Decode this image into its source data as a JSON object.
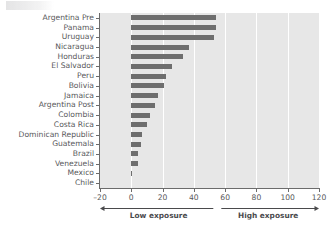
{
  "figure": {
    "title_artifact": "",
    "background_color": "#ffffff",
    "plot_background_color": "#e7e7e7",
    "bar_color": "#6e6e6e",
    "gridline_color": "#ffffff",
    "axis_color": "#6b6b6b",
    "text_color": "#58585a"
  },
  "annotation": {
    "low_label": "Low exposure",
    "high_label": "High exposure",
    "split_value": 55,
    "arrow_start": -20,
    "arrow_end": 120
  },
  "chart_data": {
    "type": "bar",
    "orientation": "horizontal",
    "title": "",
    "xlabel": "",
    "ylabel": "",
    "xlim": [
      -20,
      120
    ],
    "ylim": [
      0,
      18
    ],
    "xticks": [
      -20,
      0,
      20,
      40,
      60,
      80,
      100,
      120
    ],
    "xtick_labels": [
      "–20",
      "0",
      "20",
      "40",
      "60",
      "80",
      "100",
      "120"
    ],
    "grid": "vertical-white-at-xticks",
    "legend": "none",
    "categories": [
      "Argentina Pre",
      "Panama",
      "Uruguay",
      "Nicaragua",
      "Honduras",
      "El Salvador",
      "Peru",
      "Bolivia",
      "Jamaica",
      "Argentina Post",
      "Colombia",
      "Costa Rica",
      "Dominican Republic",
      "Guatemala",
      "Brazil",
      "Venezuela",
      "Mexico",
      "Chile"
    ],
    "values": [
      54,
      54,
      53,
      37,
      33,
      26,
      22,
      21,
      17,
      15,
      12,
      10,
      7,
      6,
      4,
      4,
      0.4,
      0
    ]
  }
}
